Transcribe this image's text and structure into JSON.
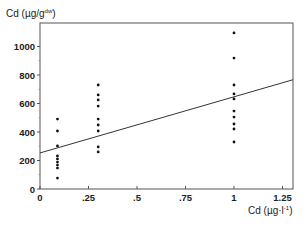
{
  "chart_data": {
    "type": "scatter",
    "title": "",
    "xlabel": "Cd (µg·l⁻¹)",
    "ylabel": "Cd (µg/g^dw)",
    "xlim": [
      0,
      1.3
    ],
    "ylim": [
      0,
      1150
    ],
    "x_ticks": [
      0,
      0.25,
      0.5,
      0.75,
      1,
      1.25
    ],
    "x_tick_labels": [
      "0",
      ".25",
      ".5",
      ".75",
      "1",
      "1.25"
    ],
    "y_ticks": [
      0,
      200,
      400,
      600,
      800,
      1000
    ],
    "y_tick_labels": [
      "0",
      "200",
      "400",
      "600",
      "800",
      "1000"
    ],
    "grid": false,
    "legend": null,
    "series": [
      {
        "name": "observations",
        "points": [
          [
            0.09,
            491
          ],
          [
            0.09,
            407
          ],
          [
            0.09,
            302
          ],
          [
            0.09,
            232
          ],
          [
            0.09,
            211
          ],
          [
            0.09,
            189
          ],
          [
            0.09,
            168
          ],
          [
            0.09,
            147
          ],
          [
            0.09,
            77
          ],
          [
            0.3,
            730
          ],
          [
            0.3,
            660
          ],
          [
            0.3,
            625
          ],
          [
            0.3,
            582
          ],
          [
            0.3,
            491
          ],
          [
            0.3,
            449
          ],
          [
            0.3,
            407
          ],
          [
            0.3,
            295
          ],
          [
            0.3,
            260
          ],
          [
            1.0,
            1095
          ],
          [
            1.0,
            919
          ],
          [
            1.0,
            730
          ],
          [
            1.0,
            667
          ],
          [
            1.0,
            632
          ],
          [
            1.0,
            547
          ],
          [
            1.0,
            505
          ],
          [
            1.0,
            456
          ],
          [
            1.0,
            421
          ],
          [
            1.0,
            330
          ]
        ]
      }
    ],
    "regression_line": {
      "intercept": 253,
      "slope": 394,
      "x_range": [
        0,
        1.3
      ]
    }
  },
  "labels": {
    "ylabel": "Cd (µg/g",
    "ylabel_sup": "dw",
    "ylabel_close": ")",
    "xlabel": "Cd (µg·l",
    "xlabel_sup": "-1",
    "xlabel_close": ")"
  }
}
